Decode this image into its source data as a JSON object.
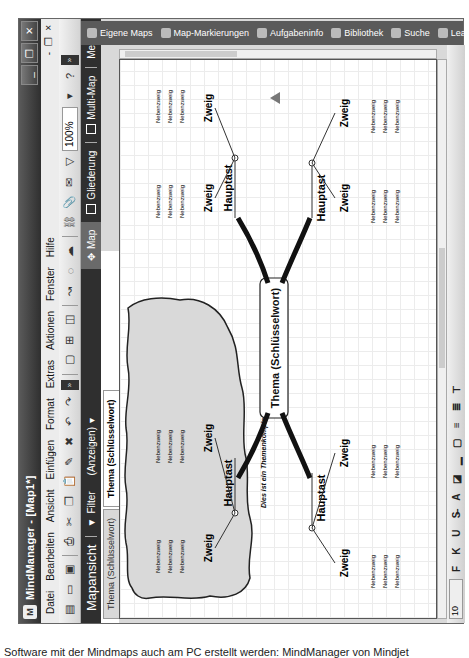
{
  "window": {
    "title": "MindManager - [Map1*]",
    "controls": {
      "minimize": "_",
      "restore": "❐",
      "close": "✕"
    }
  },
  "menubar": {
    "items": [
      "Datei",
      "Bearbeiten",
      "Ansicht",
      "Einfügen",
      "Format",
      "Extras",
      "Aktionen",
      "Fenster",
      "Hilfe"
    ],
    "mdi_controls": {
      "minimize": "-",
      "restore": "❐",
      "close": "×"
    }
  },
  "toolbar": {
    "zoom_value": "100%"
  },
  "viewbar": {
    "title": "Mapansicht",
    "filter_label": "Filter",
    "show_label": "(Anzeigen)",
    "views": [
      {
        "label": "Map",
        "icon": "map-icon",
        "active": true
      },
      {
        "label": "Gliederung",
        "icon": "outline-icon",
        "active": false
      },
      {
        "label": "Multi-Map",
        "icon": "multimap-icon",
        "active": false
      }
    ],
    "more_label": "Mehr"
  },
  "document_tabs": [
    {
      "label": "Thema (Schlüsselwort)",
      "active": false
    },
    {
      "label": "Thema (Schlüsselwort)",
      "active": true
    }
  ],
  "task_pane_tabs": [
    {
      "label": "Eigene Maps",
      "icon": "my-maps-icon"
    },
    {
      "label": "Map-Markierungen",
      "icon": "markers-icon"
    },
    {
      "label": "Aufgabeninfo",
      "icon": "task-info-icon"
    },
    {
      "label": "Bibliothek",
      "icon": "library-icon"
    },
    {
      "label": "Suche",
      "icon": "search-icon"
    },
    {
      "label": "Learning Center",
      "icon": "learning-center-icon"
    }
  ],
  "format_toolbar": {
    "font_size": "10",
    "buttons": [
      "F",
      "K",
      "U"
    ]
  },
  "mindmap": {
    "central_topic": "Thema (Schlüsselwort)",
    "boundary_callout": "Dies ist ein Themenkomplex",
    "main_topic_label": "Hauptast",
    "subtopic_label": "Zweig",
    "leaf_label": "Nebenzweig",
    "main_topics": [
      {
        "label": "Hauptast",
        "position": "upper-left",
        "in_boundary": true,
        "subtopics": [
          {
            "label": "Zweig",
            "leaves": [
              "Nebenzweig",
              "Nebenzweig",
              "Nebenzweig"
            ]
          },
          {
            "label": "Zweig",
            "leaves": [
              "Nebenzweig",
              "Nebenzweig",
              "Nebenzweig"
            ]
          }
        ]
      },
      {
        "label": "Hauptast",
        "position": "upper-right",
        "in_boundary": false,
        "subtopics": [
          {
            "label": "Zweig",
            "leaves": [
              "Nebenzweig",
              "Nebenzweig",
              "Nebenzweig"
            ]
          },
          {
            "label": "Zweig",
            "leaves": [
              "Nebenzweig",
              "Nebenzweig",
              "Nebenzweig"
            ]
          }
        ]
      },
      {
        "label": "Hauptast",
        "position": "lower-left",
        "in_boundary": false,
        "subtopics": [
          {
            "label": "Zweig",
            "leaves": [
              "Nebenzweig",
              "Nebenzweig",
              "Nebenzweig"
            ]
          },
          {
            "label": "Zweig",
            "leaves": [
              "Nebenzweig",
              "Nebenzweig",
              "Nebenzweig"
            ]
          }
        ]
      },
      {
        "label": "Hauptast",
        "position": "lower-right",
        "in_boundary": false,
        "subtopics": [
          {
            "label": "Zweig",
            "leaves": [
              "Nebenzweig",
              "Nebenzweig",
              "Nebenzweig"
            ]
          },
          {
            "label": "Zweig",
            "leaves": [
              "Nebenzweig",
              "Nebenzweig",
              "Nebenzweig"
            ]
          }
        ]
      }
    ]
  },
  "caption": "Software mit der Mindmaps auch am PC erstellt werden: MindManager von Mindjet"
}
